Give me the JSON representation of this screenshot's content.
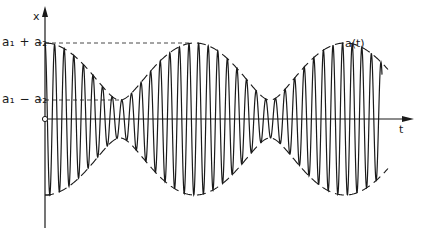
{
  "diagram": {
    "y_axis_label": "x",
    "x_axis_label": "t",
    "level_max_label": "a₁ + a₂",
    "level_min_label": "a₁ − a₂",
    "envelope_label": "a(t)",
    "colors": {
      "line": "#1a1a1a",
      "background": "#ffffff"
    },
    "geometry": {
      "axis_origin": [
        45,
        119
      ],
      "y_axis_top": 10,
      "y_axis_bottom": 228,
      "x_axis_end": 412,
      "amp_a1_px": 47.5,
      "amp_a2_px": 28.5,
      "envelope_period_px": 150,
      "carrier_period_px": 9.6,
      "signal_start_x": 45,
      "signal_end_x": 382,
      "dash_max_end_x": 190,
      "dash_min_end_x": 122
    }
  }
}
